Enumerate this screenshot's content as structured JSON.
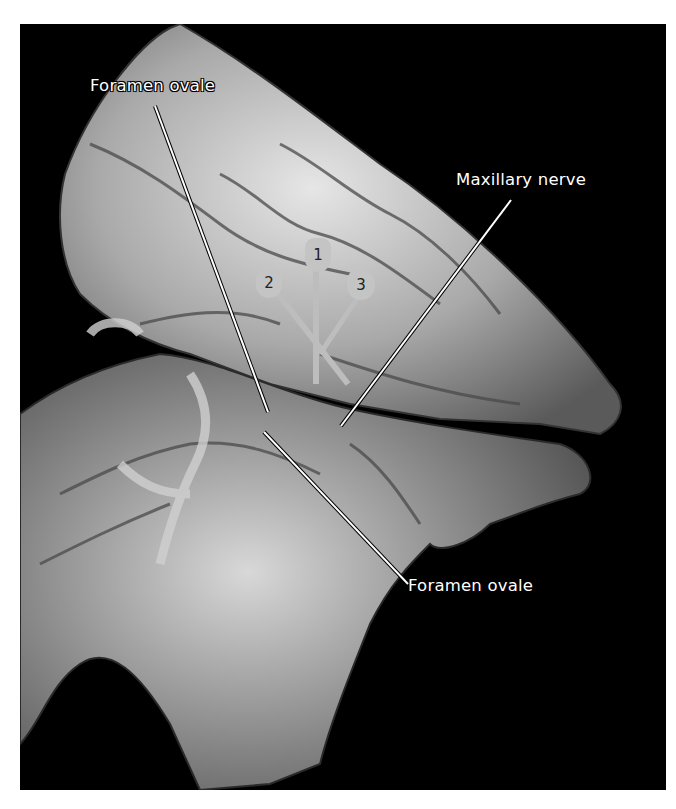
{
  "figure": {
    "colors": {
      "background": "#000000",
      "page": "#ffffff",
      "bone": "#bdbdbd",
      "needle": "#c8c8c8",
      "label_text": "#ffffff"
    }
  },
  "labels": [
    {
      "id": "foramen-ovale-top",
      "text": "Foramen ovale"
    },
    {
      "id": "maxillary-nerve",
      "text": "Maxillary nerve"
    },
    {
      "id": "foramen-ovale-bottom",
      "text": "Foramen ovale"
    }
  ],
  "needles": [
    {
      "number": "1"
    },
    {
      "number": "2"
    },
    {
      "number": "3"
    }
  ]
}
